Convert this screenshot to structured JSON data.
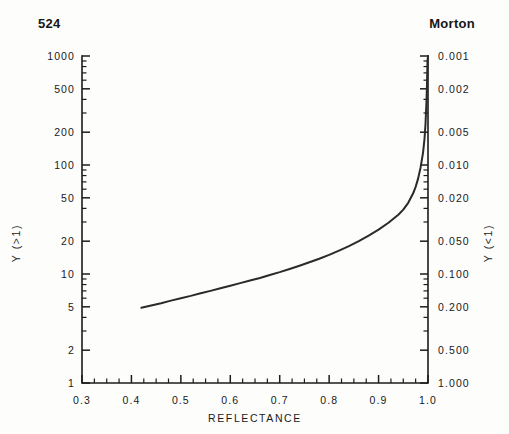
{
  "header": {
    "page_number": "524",
    "running_title": "Morton"
  },
  "chart_data": {
    "type": "line",
    "title": "",
    "xlabel": "REFLECTANCE",
    "ylabel_left": "Y (>1)",
    "ylabel_right": "Y (<1)",
    "xlim": [
      0.3,
      1.0
    ],
    "ylim": [
      1,
      1000
    ],
    "yscale": "log",
    "grid": false,
    "legend": null,
    "x_ticks": [
      0.3,
      0.4,
      0.5,
      0.6,
      0.7,
      0.8,
      0.9,
      1.0
    ],
    "x_ticklabels": [
      "0.3",
      "0.4",
      "0.5",
      "0.6",
      "0.7",
      "0.8",
      "0.9",
      "1.0"
    ],
    "x_minor_step": 0.025,
    "y_ticks_left": [
      1,
      2,
      5,
      10,
      20,
      50,
      100,
      200,
      500,
      1000
    ],
    "y_ticklabels_left": [
      "1",
      "2",
      "5",
      "10",
      "20",
      "50",
      "100",
      "200",
      "500",
      "1000"
    ],
    "y_ticks_right": [
      1,
      2,
      5,
      10,
      20,
      50,
      100,
      200,
      500,
      1000
    ],
    "y_ticklabels_right": [
      "1.000",
      "0.500",
      "0.200",
      "0.100",
      "0.050",
      "0.020",
      "0.010",
      "0.005",
      "0.002",
      "0.001"
    ],
    "series": [
      {
        "name": "contrast-ratio",
        "x": [
          0.42,
          0.44,
          0.46,
          0.48,
          0.5,
          0.52,
          0.54,
          0.56,
          0.58,
          0.6,
          0.62,
          0.64,
          0.66,
          0.68,
          0.7,
          0.72,
          0.74,
          0.76,
          0.78,
          0.8,
          0.82,
          0.84,
          0.86,
          0.88,
          0.9,
          0.92,
          0.94,
          0.95,
          0.96,
          0.97,
          0.975,
          0.98,
          0.985,
          0.99,
          0.993,
          0.995,
          0.997,
          0.998,
          0.999
        ],
        "y": [
          4.9,
          5.15,
          5.4,
          5.7,
          6.0,
          6.3,
          6.65,
          7.0,
          7.4,
          7.8,
          8.25,
          8.7,
          9.2,
          9.8,
          10.4,
          11.1,
          11.9,
          12.8,
          13.8,
          15.0,
          16.4,
          18.0,
          20.0,
          22.5,
          25.5,
          29.5,
          35.0,
          39.0,
          45.0,
          55.0,
          63.0,
          75.0,
          95.0,
          130.0,
          175.0,
          240.0,
          390.0,
          560.0,
          900.0
        ]
      }
    ]
  }
}
